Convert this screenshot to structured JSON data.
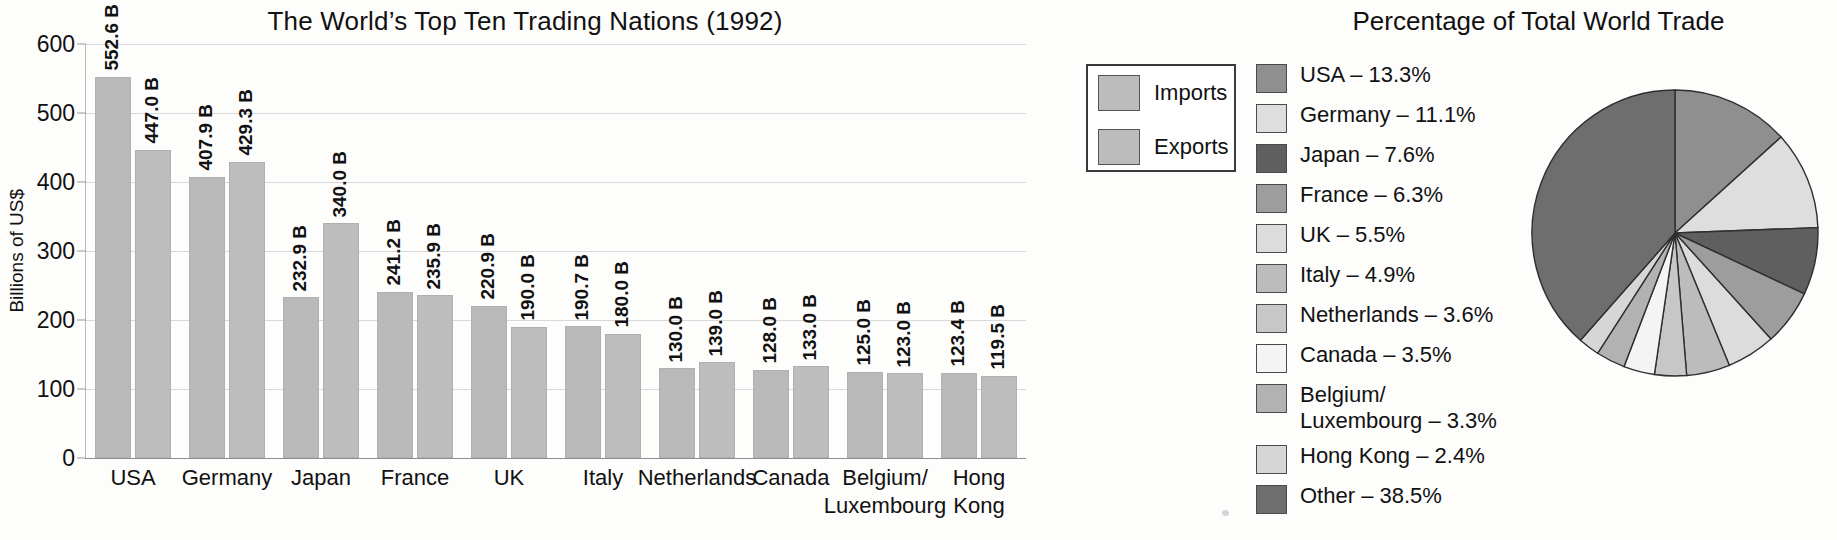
{
  "bar_chart": {
    "title": "The World’s Top Ten Trading Nations (1992)",
    "ylabel": "Billions of US$",
    "yticks": [
      "0",
      "100",
      "200",
      "300",
      "400",
      "500",
      "600"
    ],
    "legend": [
      {
        "label": "Imports",
        "color": "#bcbcbc"
      },
      {
        "label": "Exports",
        "color": "#bcbcbc"
      }
    ]
  },
  "pie_chart": {
    "title": "Percentage of Total World Trade"
  },
  "chart_data": [
    {
      "type": "bar",
      "title": "The World’s Top Ten Trading Nations (1992)",
      "xlabel": "",
      "ylabel": "Billions of US$",
      "ylim": [
        0,
        600
      ],
      "ytick_values": [
        0,
        100,
        200,
        300,
        400,
        500,
        600
      ],
      "grid": true,
      "legend_position": "top-right",
      "categories": [
        "USA",
        "Germany",
        "Japan",
        "France",
        "UK",
        "Italy",
        "Netherlands",
        "Canada",
        "Belgium/\nLuxembourg",
        "Hong\nKong"
      ],
      "series": [
        {
          "name": "Imports",
          "values": [
            552.6,
            407.9,
            232.9,
            241.2,
            220.9,
            190.7,
            130.0,
            128.0,
            125.0,
            123.4
          ],
          "labels": [
            "552.6 B",
            "407.9 B",
            "232.9 B",
            "241.2 B",
            "220.9 B",
            "190.7 B",
            "130.0 B",
            "128.0 B",
            "125.0 B",
            "123.4 B"
          ]
        },
        {
          "name": "Exports",
          "values": [
            447.0,
            429.3,
            340.0,
            235.9,
            190.0,
            180.0,
            139.0,
            133.0,
            123.0,
            119.5
          ],
          "labels": [
            "447.0 B",
            "429.3 B",
            "340.0 B",
            "235.9 B",
            "190.0 B",
            "180.0 B",
            "139.0 B",
            "133.0 B",
            "123.0 B",
            "119.5 B"
          ]
        }
      ]
    },
    {
      "type": "pie",
      "title": "Percentage of Total World Trade",
      "legend_position": "left",
      "start_angle_deg": 0,
      "direction": "clockwise",
      "labels": [
        "USA",
        "Germany",
        "Japan",
        "France",
        "UK",
        "Italy",
        "Netherlands",
        "Canada",
        "Belgium/\nLuxembourg",
        "Hong Kong",
        "Other"
      ],
      "values": [
        13.3,
        11.1,
        7.6,
        6.3,
        5.5,
        4.9,
        3.6,
        3.5,
        3.3,
        2.4,
        38.5
      ],
      "legend_entries": [
        {
          "text": "USA – 13.3%",
          "color": "#8f8f8f"
        },
        {
          "text": "Germany – 11.1%",
          "color": "#dedede"
        },
        {
          "text": "Japan – 7.6%",
          "color": "#5f5f5f"
        },
        {
          "text": "France – 6.3%",
          "color": "#9d9d9d"
        },
        {
          "text": "UK – 5.5%",
          "color": "#dcdcdc"
        },
        {
          "text": "Italy – 4.9%",
          "color": "#bcbcbc"
        },
        {
          "text": "Netherlands – 3.6%",
          "color": "#c7c7c7"
        },
        {
          "text": "Canada – 3.5%",
          "color": "#f4f4f4"
        },
        {
          "text": "Belgium/\nLuxembourg – 3.3%",
          "color": "#b2b2b2"
        },
        {
          "text": "Hong Kong – 2.4%",
          "color": "#d6d6d6"
        },
        {
          "text": "Other – 38.5%",
          "color": "#6e6e6e"
        }
      ]
    }
  ]
}
